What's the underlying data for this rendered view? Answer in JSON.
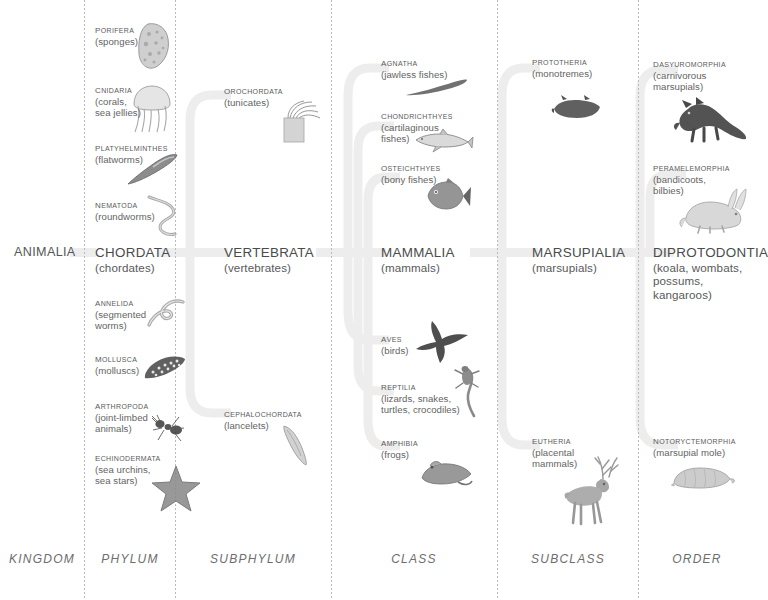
{
  "ranks": [
    {
      "id": "kingdom",
      "label": "KINGDOM",
      "x": 42
    },
    {
      "id": "phylum",
      "label": "PHYLUM",
      "x": 130
    },
    {
      "id": "subphylum",
      "label": "SUBPHYLUM",
      "x": 253
    },
    {
      "id": "class",
      "label": "CLASS",
      "x": 414
    },
    {
      "id": "subclass",
      "label": "SUBCLASS",
      "x": 568
    },
    {
      "id": "order",
      "label": "ORDER",
      "x": 697
    }
  ],
  "dividers": [
    84,
    175,
    331,
    497,
    638
  ],
  "colors": {
    "ribbon": "#eeeeee",
    "divider": "#b9b9b9",
    "text": "#545454",
    "rank_text": "#6d6d6d",
    "background": "#ffffff"
  },
  "root": {
    "name": "ANIMALIA",
    "x": 14,
    "y": 245
  },
  "columns": [
    {
      "rank": "phylum",
      "x": 95,
      "spine": {
        "name": "CHORDATA",
        "common": "(chordates)",
        "y": 245
      },
      "leaves": [
        {
          "name": "PORIFERA",
          "common": "(sponges)",
          "y": 22,
          "icon": "sponge-illustration"
        },
        {
          "name": "CNIDARIA",
          "common": "(corals,\nsea jellies)",
          "y": 82,
          "icon": "jellyfish-illustration"
        },
        {
          "name": "PLATYHELMINTHES",
          "common": "(flatworms)",
          "y": 140,
          "icon": "flatworm-illustration"
        },
        {
          "name": "NEMATODA",
          "common": "(roundworms)",
          "y": 197,
          "icon": "roundworm-illustration"
        },
        {
          "name": "ANNELIDA",
          "common": "(segmented\nworms)",
          "y": 295,
          "icon": "segmented-worm-illustration"
        },
        {
          "name": "MOLLUSCA",
          "common": "(molluscs)",
          "y": 351,
          "icon": "mollusc-shell-illustration"
        },
        {
          "name": "ARTHROPODA",
          "common": "(joint-limbed\nanimals)",
          "y": 398,
          "icon": "ant-illustration"
        },
        {
          "name": "ECHINODERMATA",
          "common": "(sea urchins,\nsea stars)",
          "y": 450,
          "icon": "starfish-illustration"
        }
      ]
    },
    {
      "rank": "subphylum",
      "x": 224,
      "spine": {
        "name": "VERTEBRATA",
        "common": "(vertebrates)",
        "y": 245
      },
      "leaves": [
        {
          "name": "OROCHORDATA",
          "common": "(tunicates)",
          "y": 83,
          "icon": "tunicate-illustration"
        },
        {
          "name": "CEPHALOCHORDATA",
          "common": "(lancelets)",
          "y": 406,
          "icon": "lancelet-illustration"
        }
      ]
    },
    {
      "rank": "class",
      "x": 381,
      "spine": {
        "name": "MAMMALIA",
        "common": "(mammals)",
        "y": 245
      },
      "leaves": [
        {
          "name": "AGNATHA",
          "common": "(jawless fishes)",
          "y": 55,
          "icon": "lamprey-illustration"
        },
        {
          "name": "CHONDRICHTHYES",
          "common": "(cartilaginous\nfishes)",
          "y": 108,
          "icon": "shark-illustration"
        },
        {
          "name": "OSTEICHTHYES",
          "common": "(bony fishes)",
          "y": 160,
          "icon": "bony-fish-illustration"
        },
        {
          "name": "AVES",
          "common": "(birds)",
          "y": 331,
          "icon": "bird-illustration"
        },
        {
          "name": "REPTILIA",
          "common": "(lizards, snakes,\nturtles, crocodiles)",
          "y": 379,
          "icon": "lizard-illustration"
        },
        {
          "name": "AMPHIBIA",
          "common": "(frogs)",
          "y": 435,
          "icon": "frog-illustration"
        }
      ]
    },
    {
      "rank": "subclass",
      "x": 532,
      "spine": {
        "name": "MARSUPIALIA",
        "common": "(marsupials)",
        "y": 245
      },
      "leaves": [
        {
          "name": "PROTOTHERIA",
          "common": "(monotremes)",
          "y": 54,
          "icon": "platypus-illustration"
        },
        {
          "name": "EUTHERIA",
          "common": "(placental\nmammals)",
          "y": 433,
          "icon": "deer-illustration"
        }
      ]
    },
    {
      "rank": "order",
      "x": 653,
      "spine": {
        "name": "DIPROTODONTIA",
        "common": "(koala, wombats,\npossums,\nkangaroos)",
        "y": 245
      },
      "leaves": [
        {
          "name": "DASYUROMORPHIA",
          "common": "(carnivorous\nmarsupials)",
          "y": 56,
          "icon": "tasmanian-devil-illustration"
        },
        {
          "name": "PERAMELEMORPHIA",
          "common": "(bandicoots,\nbilbies)",
          "y": 160,
          "icon": "bilby-illustration"
        },
        {
          "name": "NOTORYCTEMORPHIA",
          "common": "(marsupial mole)",
          "y": 433,
          "icon": "marsupial-mole-illustration"
        }
      ]
    }
  ]
}
